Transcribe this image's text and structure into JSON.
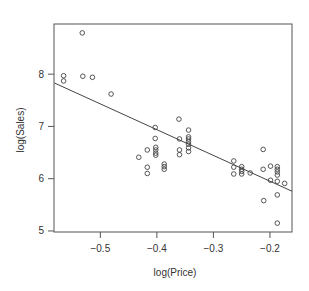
{
  "chart_data": {
    "type": "scatter",
    "title": "",
    "xlabel": "log(Price)",
    "ylabel": "log(Sales)",
    "xlim": [
      -0.582,
      -0.161
    ],
    "ylim": [
      4.98,
      8.96
    ],
    "x_ticks": [
      -0.5,
      -0.4,
      -0.3,
      -0.2
    ],
    "x_tick_labels": [
      "−0.5",
      "−0.4",
      "−0.3",
      "−0.2"
    ],
    "y_ticks": [
      5,
      6,
      7,
      8
    ],
    "y_tick_labels": [
      "5",
      "6",
      "7",
      "8"
    ],
    "grid": false,
    "legend": null,
    "marker": "open-circle",
    "colors": {
      "points": "#444444",
      "line": "#444444",
      "axis": "#555555",
      "text": "#333333"
    },
    "regression_line": {
      "x": [
        -0.581,
        -0.161
      ],
      "y": [
        7.83,
        5.76
      ]
    },
    "points": [
      {
        "x": -0.532,
        "y": 8.79
      },
      {
        "x": -0.565,
        "y": 7.97
      },
      {
        "x": -0.565,
        "y": 7.87
      },
      {
        "x": -0.531,
        "y": 7.96
      },
      {
        "x": -0.514,
        "y": 7.94
      },
      {
        "x": -0.481,
        "y": 7.62
      },
      {
        "x": -0.403,
        "y": 6.98
      },
      {
        "x": -0.403,
        "y": 6.77
      },
      {
        "x": -0.417,
        "y": 6.55
      },
      {
        "x": -0.432,
        "y": 6.41
      },
      {
        "x": -0.402,
        "y": 6.6
      },
      {
        "x": -0.402,
        "y": 6.55
      },
      {
        "x": -0.402,
        "y": 6.49
      },
      {
        "x": -0.402,
        "y": 6.45
      },
      {
        "x": -0.417,
        "y": 6.22
      },
      {
        "x": -0.417,
        "y": 6.1
      },
      {
        "x": -0.387,
        "y": 6.28
      },
      {
        "x": -0.387,
        "y": 6.23
      },
      {
        "x": -0.387,
        "y": 6.18
      },
      {
        "x": -0.361,
        "y": 7.14
      },
      {
        "x": -0.344,
        "y": 6.93
      },
      {
        "x": -0.36,
        "y": 6.76
      },
      {
        "x": -0.344,
        "y": 6.8
      },
      {
        "x": -0.344,
        "y": 6.76
      },
      {
        "x": -0.344,
        "y": 6.71
      },
      {
        "x": -0.344,
        "y": 6.66
      },
      {
        "x": -0.344,
        "y": 6.59
      },
      {
        "x": -0.344,
        "y": 6.52
      },
      {
        "x": -0.36,
        "y": 6.55
      },
      {
        "x": -0.36,
        "y": 6.46
      },
      {
        "x": -0.264,
        "y": 6.34
      },
      {
        "x": -0.264,
        "y": 6.22
      },
      {
        "x": -0.264,
        "y": 6.09
      },
      {
        "x": -0.25,
        "y": 6.23
      },
      {
        "x": -0.25,
        "y": 6.18
      },
      {
        "x": -0.25,
        "y": 6.14
      },
      {
        "x": -0.25,
        "y": 6.09
      },
      {
        "x": -0.235,
        "y": 6.11
      },
      {
        "x": -0.212,
        "y": 6.56
      },
      {
        "x": -0.212,
        "y": 6.18
      },
      {
        "x": -0.199,
        "y": 6.24
      },
      {
        "x": -0.187,
        "y": 6.23
      },
      {
        "x": -0.187,
        "y": 6.18
      },
      {
        "x": -0.187,
        "y": 6.13
      },
      {
        "x": -0.187,
        "y": 6.07
      },
      {
        "x": -0.199,
        "y": 5.97
      },
      {
        "x": -0.187,
        "y": 5.95
      },
      {
        "x": -0.174,
        "y": 5.91
      },
      {
        "x": -0.211,
        "y": 5.58
      },
      {
        "x": -0.187,
        "y": 5.69
      },
      {
        "x": -0.187,
        "y": 5.15
      }
    ]
  },
  "layout": {
    "plot_box": {
      "left": 54,
      "top": 24,
      "right": 292,
      "bottom": 232
    }
  }
}
